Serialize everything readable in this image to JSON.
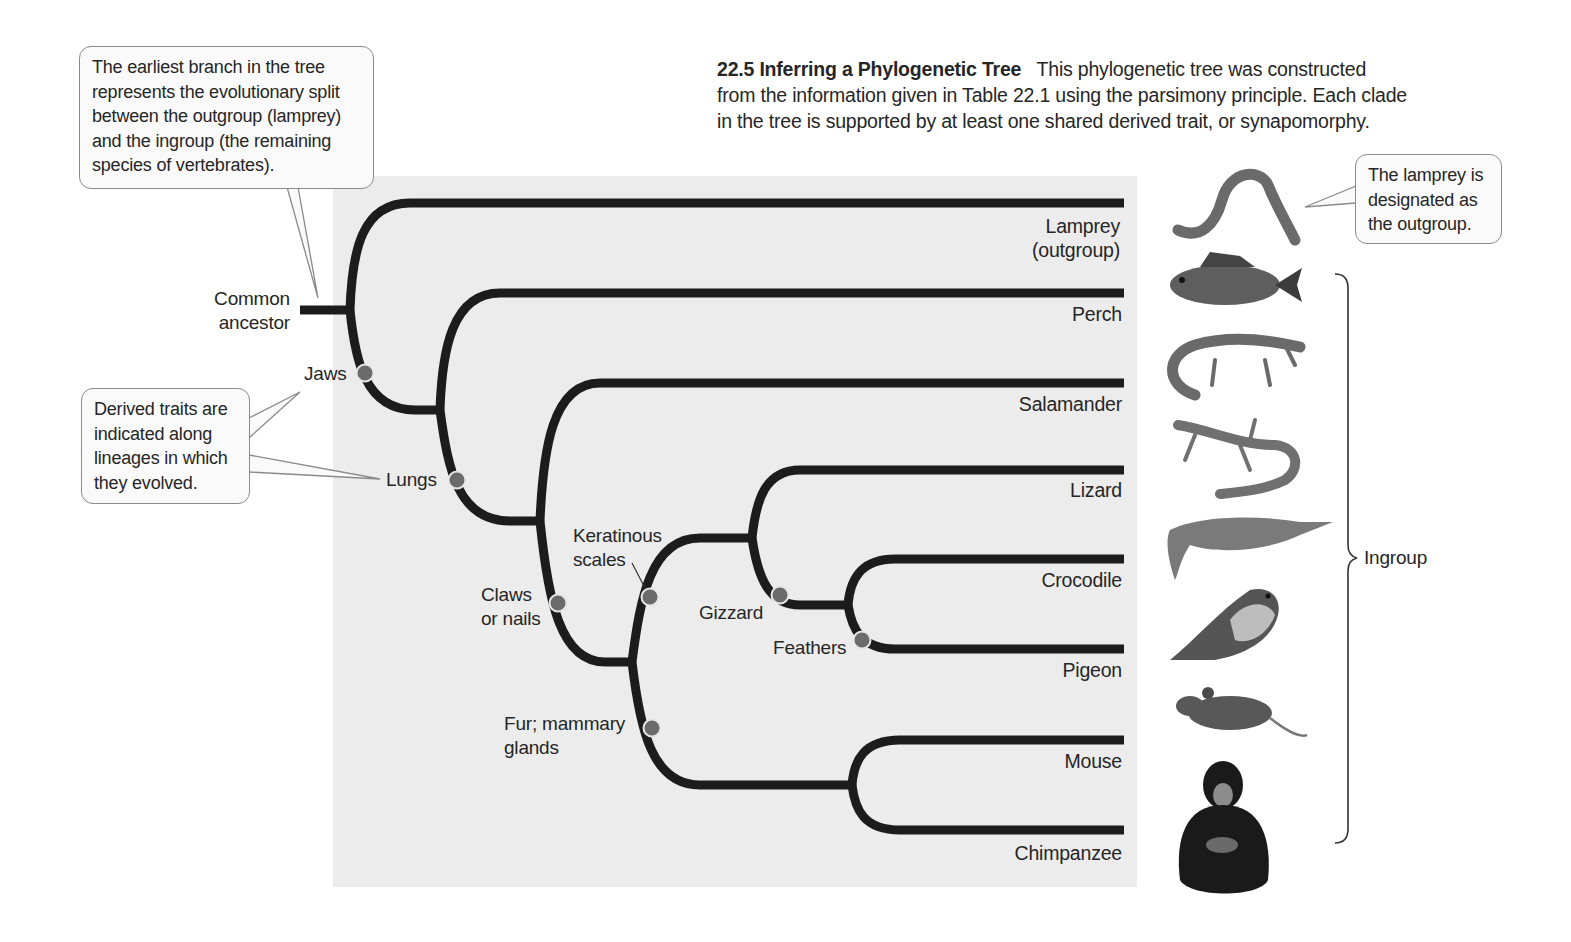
{
  "figure": {
    "number": "22.5",
    "title": "Inferring a Phylogenetic Tree",
    "caption": "This phylogenetic tree was constructed from the information given in Table 22.1 using the parsimony principle. Each clade in the tree is supported by at least one shared derived trait, or synapomorphy.",
    "caption_lines": [
      "This phylogenetic tree was constructed",
      "from the information given in Table 22.1 using the parsimony principle. Each clade",
      "in the tree is supported by at least one shared derived trait, or synapomorphy."
    ]
  },
  "callouts": {
    "earliest_branch": "The earliest branch in the tree represents the evolutionary split between the outgroup (lamprey) and the ingroup (the remaining species of vertebrates).",
    "earliest_branch_lines": [
      "The earliest branch in the tree",
      "represents the evolutionary split",
      "between the outgroup (lamprey)",
      "and the ingroup (the remaining",
      "species of vertebrates)."
    ],
    "derived_traits_lines": [
      "Derived traits are",
      "indicated along",
      "lineages in which",
      "they evolved."
    ],
    "outgroup_lines": [
      "The lamprey is",
      "designated as",
      "the outgroup."
    ]
  },
  "root_label": [
    "Common",
    "ancestor"
  ],
  "traits": [
    {
      "id": "jaws",
      "lines": [
        "Jaws"
      ]
    },
    {
      "id": "lungs",
      "lines": [
        "Lungs"
      ]
    },
    {
      "id": "claws",
      "lines": [
        "Claws",
        "or nails"
      ]
    },
    {
      "id": "keratinous",
      "lines": [
        "Keratinous",
        "scales"
      ]
    },
    {
      "id": "gizzard",
      "lines": [
        "Gizzard"
      ]
    },
    {
      "id": "feathers",
      "lines": [
        "Feathers"
      ]
    },
    {
      "id": "fur",
      "lines": [
        "Fur; mammary",
        "glands"
      ]
    }
  ],
  "taxa": [
    {
      "name": "Lamprey",
      "sub": "(outgroup)",
      "animal": "lamprey"
    },
    {
      "name": "Perch",
      "animal": "perch"
    },
    {
      "name": "Salamander",
      "animal": "salamander"
    },
    {
      "name": "Lizard",
      "animal": "lizard"
    },
    {
      "name": "Crocodile",
      "animal": "crocodile"
    },
    {
      "name": "Pigeon",
      "animal": "pigeon"
    },
    {
      "name": "Mouse",
      "animal": "mouse"
    },
    {
      "name": "Chimpanzee",
      "animal": "chimpanzee"
    }
  ],
  "ingroup_label": "Ingroup",
  "colors": {
    "branch": "#1c1c1c",
    "trait_dot": "#6b6b6b",
    "trait_ring": "#e6e6e6",
    "panel": "#ececec",
    "callout_border": "#8a8a8a"
  }
}
